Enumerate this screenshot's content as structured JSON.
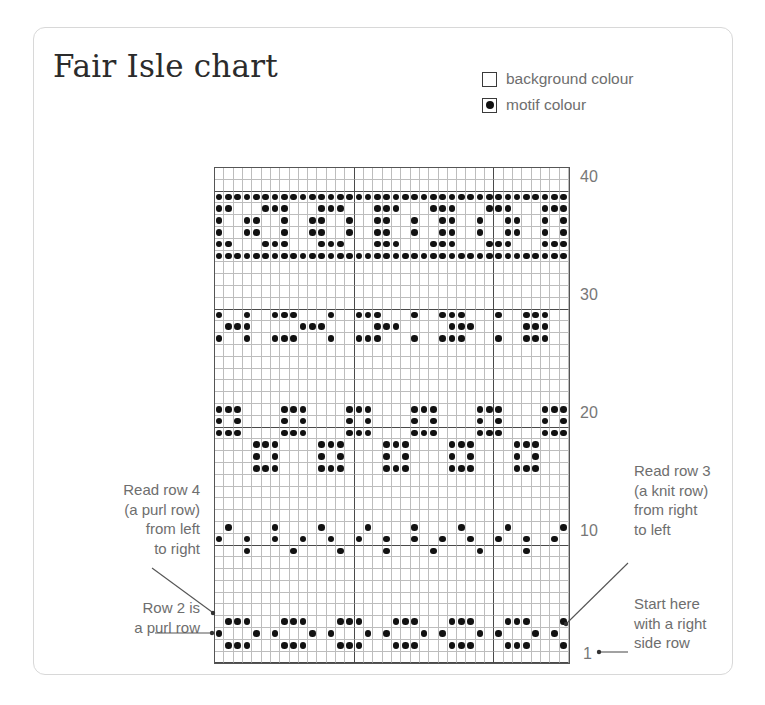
{
  "title": "Fair Isle chart",
  "legend": {
    "items": [
      {
        "icon": "empty-square-icon",
        "label": "background colour",
        "filled": false
      },
      {
        "icon": "filled-dot-square-icon",
        "label": "motif colour",
        "filled": true
      }
    ]
  },
  "annotations": {
    "read_row_4": "Read row 4\n(a purl row)\nfrom left\nto right",
    "read_row_4_lines": [
      "Read row 4",
      "(a purl row)",
      "from left",
      "to right"
    ],
    "row_2": "Row 2 is\na purl row",
    "row_2_lines": [
      "Row 2 is",
      "a purl row"
    ],
    "read_row_3_lines": [
      "Read row 3",
      "(a knit row)",
      "from right",
      "to left"
    ],
    "start_here_lines": [
      "Start here",
      "with a right",
      "side row"
    ]
  },
  "colors": {
    "motif": "#111111",
    "background": "#ffffff",
    "grid_light": "#bdbdbd",
    "grid_heavy": "#4a4a4a",
    "text": "#6e6e6e",
    "title": "#2b2b2b",
    "card_border": "#d8d8d8"
  },
  "chart_data": {
    "type": "heatmap",
    "title": "Fair Isle chart",
    "columns": 38,
    "rows": 42,
    "row_labels": [
      {
        "label": "40",
        "row_index_from_top": 1
      },
      {
        "label": "30",
        "row_index_from_top": 11
      },
      {
        "label": "20",
        "row_index_from_top": 21
      },
      {
        "label": "10",
        "row_index_from_top": 31
      },
      {
        "label": "1",
        "row_index_from_top": 41
      }
    ],
    "major_gridline_rows_from_top": [
      1,
      11,
      21,
      31,
      41
    ],
    "major_gridline_cols": [
      15,
      30
    ],
    "legend": [
      "background colour",
      "motif colour"
    ],
    "xlabel": "",
    "ylabel": "",
    "grid": [
      "......................................",
      "......................................",
      "XXXXXXXXXXXXXXXXXXXXXXXXXXXXXXXXXXXXXX",
      "XX...XXX...XXX...XXX...XXX...XXX...XXX",
      "X..XX..X..XX..X..XX..X..XX..X..XX..X.X",
      "X..XX..X..XX..X..XX..X..XX..X..XX..X.X",
      "XX...XXX...XXX...XXX...XXX...XXX...XXX",
      "XXXXXXXXXXXXXXXXXXXXXXXXXXXXXXXXXXXXXX",
      "......................................",
      "......................................",
      "......................................",
      "......................................",
      "X..X..XXX...X..XXX...X..XXX...X..XXX..",
      ".XXX.....XXX.....XXX.....XXX.....XXX..",
      "X..X..XXX...X..XXX...X..XXX...X..XXX..",
      "......................................",
      "......................................",
      "......................................",
      "......................................",
      "......................................",
      "XXX....XXX....XXX....XXX....XXX....XXX",
      "X.X....X.X....X.X....X.X....X.X....X.X",
      "XXX....XXX....XXX....XXX....XXX....XXX",
      "....XXX....XXX....XXX....XXX....XXX...",
      "....X.X....X.X....X.X....X.X....X.X...",
      "....XXX....XXX....XXX....XXX....XXX...",
      "......................................",
      "......................................",
      "......................................",
      "......................................",
      ".X....X....X....X....X....X....X.....X",
      "X..X..X..X..X..X..X..X..X..X..X..X..X.",
      "...X....X....X....X....X....X....X....",
      "......................................",
      "......................................",
      "......................................",
      "......................................",
      "......................................",
      ".XXX...XXX...XXX...XXX...XXX...XXX...X",
      "X...X.X...X.X...X.X...X.X...X.X...X.X.",
      ".XXX...XXX...XXX...XXX...XXX...XXX...X",
      "......................................"
    ]
  }
}
